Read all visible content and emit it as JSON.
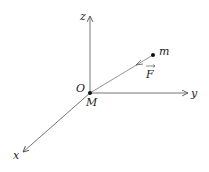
{
  "diagram": {
    "type": "3d-coordinate-axes",
    "origin": {
      "label": "O",
      "point_label": "M"
    },
    "axes": [
      {
        "name": "z",
        "label": "z",
        "direction": "up"
      },
      {
        "name": "y",
        "label": "y",
        "direction": "right"
      },
      {
        "name": "x",
        "label": "x",
        "direction": "down-left"
      }
    ],
    "mass_point": {
      "label": "m"
    },
    "force": {
      "label": "F",
      "vector": true,
      "direction": "from m toward M"
    },
    "colors": {
      "line": "#555555",
      "text": "#222222",
      "point": "#111111"
    }
  }
}
